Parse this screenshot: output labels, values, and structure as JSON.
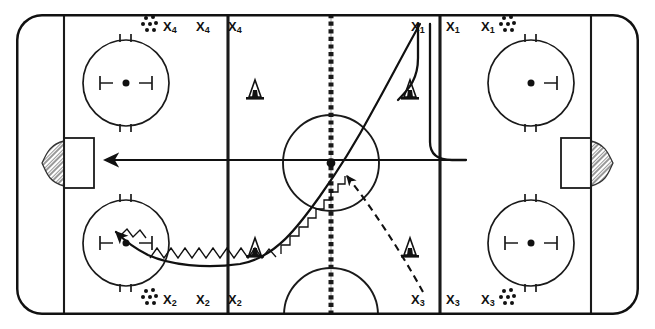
{
  "diagram": {
    "type": "ice-hockey-drill-diagram",
    "surface": "ice-rink",
    "colors": {
      "line": "#1a1a1a",
      "board": "#111111",
      "ice": "#ffffff",
      "net_hatch": "#555555"
    },
    "rink": {
      "board_stroke_width": 5,
      "corner_radius": 26,
      "line_stroke_width": 2.2,
      "bounds": {
        "x": 16,
        "y": 14,
        "width": 623,
        "height": 301
      }
    }
  },
  "lines": {
    "goal_line_left": {
      "x": 64,
      "label": "goal-line-left"
    },
    "goal_line_right": {
      "x": 591,
      "label": "goal-line-right"
    },
    "blue_line_left": {
      "x": 228,
      "label": "blue-line-left"
    },
    "blue_line_right": {
      "x": 440,
      "label": "blue-line-right"
    },
    "center_line": {
      "x": 331,
      "label": "center-line",
      "style": "dashed"
    },
    "center_dot": {
      "cx": 331,
      "cy": 163,
      "r": 4.2
    },
    "center_circle": {
      "cx": 331,
      "cy": 163,
      "r": 48
    },
    "referee_crease": {
      "cx": 331,
      "cy": 313,
      "r": 47
    }
  },
  "faceoff_circles": [
    {
      "name": "faceoff-circle-top-left",
      "cx": 126,
      "cy": 83,
      "r": 43,
      "hash": "both"
    },
    {
      "name": "faceoff-circle-bottom-left",
      "cx": 126,
      "cy": 243,
      "r": 43,
      "hash": "both"
    },
    {
      "name": "faceoff-circle-top-right",
      "cx": 531,
      "cy": 83,
      "r": 43,
      "hash": "right"
    },
    {
      "name": "faceoff-circle-bottom-right",
      "cx": 531,
      "cy": 243,
      "r": 43,
      "hash": "both"
    }
  ],
  "goals": [
    {
      "name": "goal-left",
      "x": 41,
      "y": 138,
      "width": 30,
      "height": 50,
      "net_side": "left"
    },
    {
      "name": "goal-right",
      "x": 584,
      "y": 138,
      "width": 30,
      "height": 50,
      "net_side": "right"
    }
  ],
  "cones": [
    {
      "name": "cone-top-left-zone",
      "x": 248,
      "y": 86
    },
    {
      "name": "cone-top-right-zone",
      "x": 409,
      "y": 86
    },
    {
      "name": "cone-bottom-left-zone",
      "x": 248,
      "y": 244
    },
    {
      "name": "cone-bottom-right-zone",
      "x": 409,
      "y": 244
    }
  ],
  "player_groups": [
    {
      "id": "group-x4",
      "label": "X4",
      "label_text": "X",
      "label_sub": "4",
      "corner": "top-left",
      "puck_cluster": {
        "x": 140,
        "y": 22,
        "align": "left-of-labels"
      },
      "labels": [
        {
          "name": "player-label-x4-1",
          "x": 163,
          "y": 20
        },
        {
          "name": "player-label-x4-2",
          "x": 196,
          "y": 20
        },
        {
          "name": "player-label-x4-3",
          "x": 228,
          "y": 20
        }
      ]
    },
    {
      "id": "group-x1",
      "label": "X1",
      "label_text": "X",
      "label_sub": "1",
      "corner": "top-right",
      "puck_cluster": {
        "x": 508,
        "y": 22,
        "align": "right-of-labels"
      },
      "labels": [
        {
          "name": "player-label-x1-1",
          "x": 411,
          "y": 20
        },
        {
          "name": "player-label-x1-2",
          "x": 446,
          "y": 20
        },
        {
          "name": "player-label-x1-3",
          "x": 481,
          "y": 20
        }
      ]
    },
    {
      "id": "group-x2",
      "label": "X2",
      "label_text": "X",
      "label_sub": "2",
      "corner": "bottom-left",
      "puck_cluster": {
        "x": 140,
        "y": 295,
        "align": "left-of-labels"
      },
      "labels": [
        {
          "name": "player-label-x2-1",
          "x": 163,
          "y": 293
        },
        {
          "name": "player-label-x2-2",
          "x": 196,
          "y": 293
        },
        {
          "name": "player-label-x2-3",
          "x": 228,
          "y": 293
        }
      ]
    },
    {
      "id": "group-x3",
      "label": "X3",
      "label_text": "X",
      "label_sub": "3",
      "corner": "bottom-right",
      "puck_cluster": {
        "x": 508,
        "y": 295,
        "align": "right-of-labels"
      },
      "labels": [
        {
          "name": "player-label-x3-1",
          "x": 411,
          "y": 293
        },
        {
          "name": "player-label-x3-2",
          "x": 446,
          "y": 293
        },
        {
          "name": "player-label-x3-3",
          "x": 481,
          "y": 293
        }
      ]
    }
  ],
  "paths": [
    {
      "name": "puck-carry-path",
      "style": "zigzag-stickhandle",
      "description": "X3 start near bottom-right, curving left along the bottom then up through center ice",
      "arrowhead": "up-left into bottom-left faceoff circle"
    },
    {
      "name": "skate-path-x1-curl",
      "style": "solid-curve",
      "description": "X1 skates down and curls left toward center ice"
    },
    {
      "name": "skate-path-x1-outside",
      "style": "solid-curve",
      "description": "second X1 lane down then bending left above the blue line"
    },
    {
      "name": "long-pass-arrow",
      "style": "solid-arrow",
      "description": "long horizontal arrow toward the left goal"
    },
    {
      "name": "pass-line-x3",
      "style": "dashed-arrow",
      "description": "dashed pass from X3 corner up to the center ice dot"
    }
  ]
}
